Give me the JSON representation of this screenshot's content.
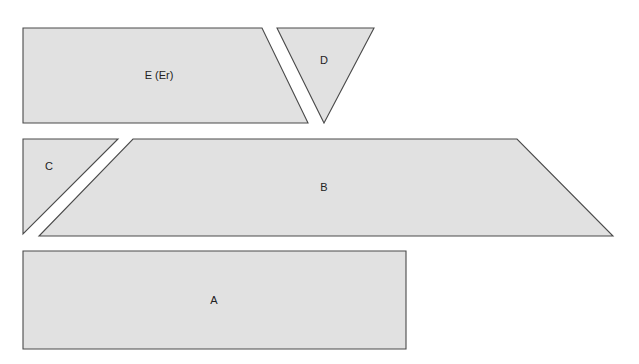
{
  "diagram": {
    "fill_color": "#e1e1e1",
    "stroke_color": "#4a4a4a",
    "pieces": [
      {
        "id": "E",
        "label": "E (Er)",
        "shape": "trapezoid",
        "points": "23,28 262,28 308,123 23,123",
        "label_pos": [
          159,
          76
        ]
      },
      {
        "id": "D",
        "label": "D",
        "shape": "triangle",
        "points": "277,28 374,28 324,123",
        "label_pos": [
          324,
          61
        ]
      },
      {
        "id": "C",
        "label": "C",
        "shape": "triangle",
        "points": "23,139 118,139 23,234",
        "label_pos": [
          49,
          167
        ]
      },
      {
        "id": "B",
        "label": "B",
        "shape": "trapezoid",
        "points": "133,139 517,139 613,236 39,236",
        "label_pos": [
          324,
          188
        ]
      },
      {
        "id": "A",
        "label": "A",
        "shape": "rectangle",
        "points": "23,251 406,251 406,349 23,349",
        "label_pos": [
          214,
          301
        ]
      }
    ]
  }
}
